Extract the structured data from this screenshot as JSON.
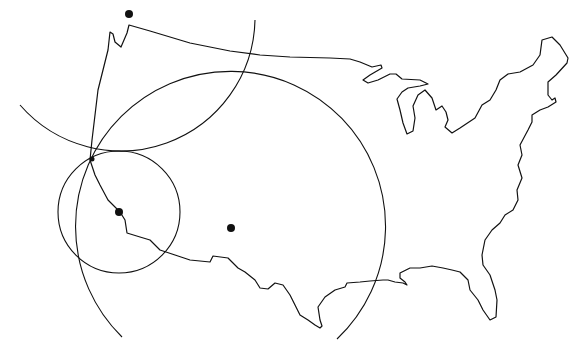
{
  "figure": {
    "title": "",
    "colors": {
      "stroke": "#111111",
      "background": "#ffffff"
    }
  },
  "stations": [
    {
      "id": "station-north",
      "cx": 129,
      "cy": 14,
      "r": 4
    },
    {
      "id": "station-west",
      "cx": 119,
      "cy": 212,
      "r": 4
    },
    {
      "id": "station-central",
      "cx": 231,
      "cy": 228,
      "r": 4
    }
  ],
  "range_circles": [
    {
      "id": "range-circle-north",
      "cx": 125,
      "cy": 25,
      "r": 134
    },
    {
      "id": "range-circle-west",
      "cx": 119,
      "cy": 212,
      "r": 61
    },
    {
      "id": "range-circle-central",
      "cx": 231,
      "cy": 228,
      "r": 155
    }
  ],
  "intersection_point": {
    "x": 92,
    "y": 159,
    "r": 2.5
  }
}
